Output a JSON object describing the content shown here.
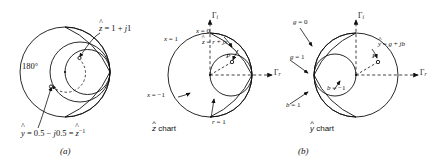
{
  "figure": {
    "type": "smith-chart-diagram",
    "panels": [
      {
        "id": "a",
        "caption": "(a)",
        "labels": {
          "z_point": "ẑ = 1 + j1",
          "angle": "180°",
          "y_point": "ŷ = 0.5 − j0.5 = ẑ⁻¹"
        }
      },
      {
        "id": "b-left",
        "caption": "(b)",
        "chart_name": "ẑ chart",
        "labels": {
          "gamma_i_axis": "Γi",
          "gamma_r_axis": "Γr",
          "x_zero": "x = 0",
          "z_formula": "ẑ = r + jx",
          "x_one": "x = 1",
          "x_minus_one": "x = −1",
          "r_one": "r = 1",
          "point": "P"
        }
      },
      {
        "id": "b-right",
        "chart_name": "ŷ chart",
        "labels": {
          "gamma_i_axis": "Γi",
          "gamma_r_axis": "Γr",
          "g_zero": "g = 0",
          "y_formula": "ŷ = g + jb",
          "g_one": "g = 1",
          "b_one": "b = 1",
          "b_minus_one": "b = −1",
          "point": "P"
        }
      }
    ],
    "colors": {
      "ink": "#111111",
      "background": "#ffffff"
    }
  }
}
